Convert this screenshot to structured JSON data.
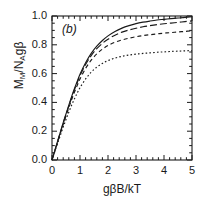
{
  "figure": {
    "panel_label": "(b)",
    "background_color": "#ffffff",
    "line_color": "#1a1a1a"
  },
  "chart_data": {
    "type": "line",
    "title": "",
    "subtitle": "",
    "panel_label": "(b)",
    "xlabel": "gβB/kT",
    "ylabel_plain": "M_M/N_Agβ",
    "ylabel_parts": {
      "m": "M",
      "m_sub": "M",
      "slash": "/",
      "n": "N",
      "n_sub": "A",
      "gbeta": "gβ"
    },
    "xlim": [
      0,
      5
    ],
    "ylim": [
      0.0,
      1.0
    ],
    "xticks": [
      0,
      1,
      2,
      3,
      4,
      5
    ],
    "xtick_labels": [
      "0",
      "1",
      "2",
      "3",
      "4",
      "5"
    ],
    "yticks": [
      0.0,
      0.2,
      0.4,
      0.6,
      0.8,
      1.0
    ],
    "ytick_labels": [
      "0.0",
      "0.2",
      "0.4",
      "0.6",
      "0.8",
      "1.0"
    ],
    "x_minor_tick_interval": 0.2,
    "y_minor_tick_interval": 0.05,
    "ticks_direction": "in",
    "ticks_all_sides": true,
    "grid": false,
    "legend": null,
    "legend_position": "none",
    "x": [
      0,
      0.1,
      0.2,
      0.3,
      0.4,
      0.5,
      0.6,
      0.7,
      0.8,
      0.9,
      1.0,
      1.2,
      1.4,
      1.6,
      1.8,
      2.0,
      2.25,
      2.5,
      2.75,
      3.0,
      3.25,
      3.5,
      3.75,
      4.0,
      4.25,
      4.5,
      4.75,
      5.0
    ],
    "series": [
      {
        "name": "solid",
        "style": "solid",
        "dash": "none",
        "values": [
          0.0,
          0.065,
          0.13,
          0.195,
          0.26,
          0.32,
          0.38,
          0.44,
          0.495,
          0.545,
          0.595,
          0.675,
          0.74,
          0.79,
          0.83,
          0.862,
          0.893,
          0.916,
          0.933,
          0.947,
          0.957,
          0.965,
          0.972,
          0.977,
          0.982,
          0.986,
          0.99,
          0.995
        ]
      },
      {
        "name": "long-dash",
        "style": "dashed",
        "dash": "7,3",
        "values": [
          0.0,
          0.064,
          0.128,
          0.192,
          0.255,
          0.315,
          0.374,
          0.432,
          0.487,
          0.537,
          0.585,
          0.663,
          0.725,
          0.773,
          0.81,
          0.839,
          0.867,
          0.888,
          0.903,
          0.915,
          0.925,
          0.933,
          0.94,
          0.946,
          0.951,
          0.956,
          0.961,
          0.966
        ]
      },
      {
        "name": "medium-dash",
        "style": "dashed",
        "dash": "4,3",
        "values": [
          0.0,
          0.062,
          0.124,
          0.186,
          0.247,
          0.306,
          0.363,
          0.418,
          0.47,
          0.518,
          0.563,
          0.636,
          0.693,
          0.737,
          0.77,
          0.795,
          0.818,
          0.834,
          0.846,
          0.856,
          0.864,
          0.87,
          0.876,
          0.881,
          0.885,
          0.889,
          0.893,
          0.897
        ]
      },
      {
        "name": "dotted",
        "style": "dotted",
        "dash": "1.6,2.2",
        "values": [
          0.0,
          0.058,
          0.115,
          0.172,
          0.228,
          0.281,
          0.332,
          0.38,
          0.424,
          0.465,
          0.502,
          0.563,
          0.61,
          0.645,
          0.671,
          0.69,
          0.708,
          0.72,
          0.729,
          0.735,
          0.74,
          0.744,
          0.748,
          0.751,
          0.754,
          0.756,
          0.758,
          0.76
        ]
      }
    ]
  }
}
